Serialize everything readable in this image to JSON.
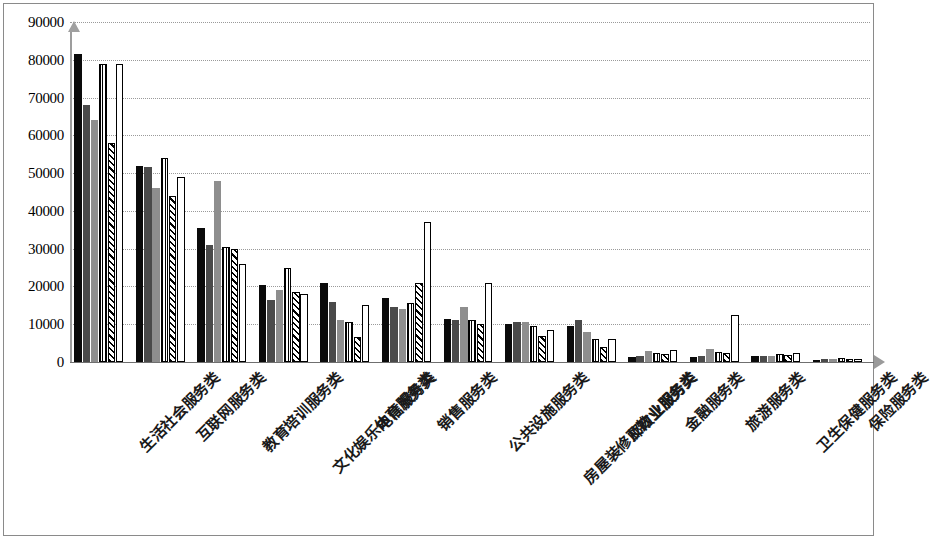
{
  "chart_data": {
    "type": "bar",
    "title": "",
    "xlabel": "",
    "ylabel": "",
    "ylim": [
      0,
      90000
    ],
    "ytick_step": 10000,
    "grid": true,
    "legend": "none",
    "yticks": [
      "0",
      "10000",
      "20000",
      "30000",
      "40000",
      "50000",
      "60000",
      "70000",
      "80000",
      "90000"
    ],
    "categories": [
      "生活社会服务类",
      "互联网服务类",
      "教育培训服务类",
      "文化娱乐体育服务类",
      "电信服务类",
      "销售服务类",
      "公共设施服务类",
      "房屋装修及物业服务类",
      "邮政业服务类",
      "金融服务类",
      "旅游服务类",
      "卫生保健服务类",
      "保险服务类"
    ],
    "series": [
      {
        "name": "系列1",
        "pattern": "solid-black",
        "color": "#0a0a0a",
        "values": [
          81500,
          52000,
          35500,
          20500,
          21000,
          17000,
          11500,
          10000,
          9500,
          1200,
          1300,
          1600,
          600
        ]
      },
      {
        "name": "系列2",
        "pattern": "solid-dark-gray",
        "color": "#4a4a4a",
        "values": [
          68000,
          51500,
          31000,
          16500,
          16000,
          14500,
          11000,
          10500,
          11000,
          1600,
          1600,
          1500,
          700
        ]
      },
      {
        "name": "系列3",
        "pattern": "solid-medium-gray",
        "color": "#8e8e8e",
        "values": [
          64000,
          46000,
          48000,
          19000,
          11000,
          14000,
          14500,
          10500,
          8000,
          3000,
          3500,
          1700,
          700
        ]
      },
      {
        "name": "系列4",
        "pattern": "vertical-dotted",
        "color": "#ffffff",
        "values": [
          79000,
          54000,
          30500,
          25000,
          10500,
          15500,
          11000,
          9500,
          6000,
          2500,
          2700,
          2100,
          1000
        ]
      },
      {
        "name": "系列5",
        "pattern": "diagonal-hatch",
        "color": "#ffffff",
        "values": [
          58000,
          44000,
          30000,
          18500,
          6500,
          21000,
          10000,
          7000,
          4000,
          2200,
          2400,
          1800,
          900
        ]
      },
      {
        "name": "系列6",
        "pattern": "white-outline",
        "color": "#ffffff",
        "values": [
          79000,
          49000,
          26000,
          18000,
          15000,
          37000,
          21000,
          8500,
          6000,
          3200,
          12500,
          2400,
          800
        ]
      }
    ]
  }
}
